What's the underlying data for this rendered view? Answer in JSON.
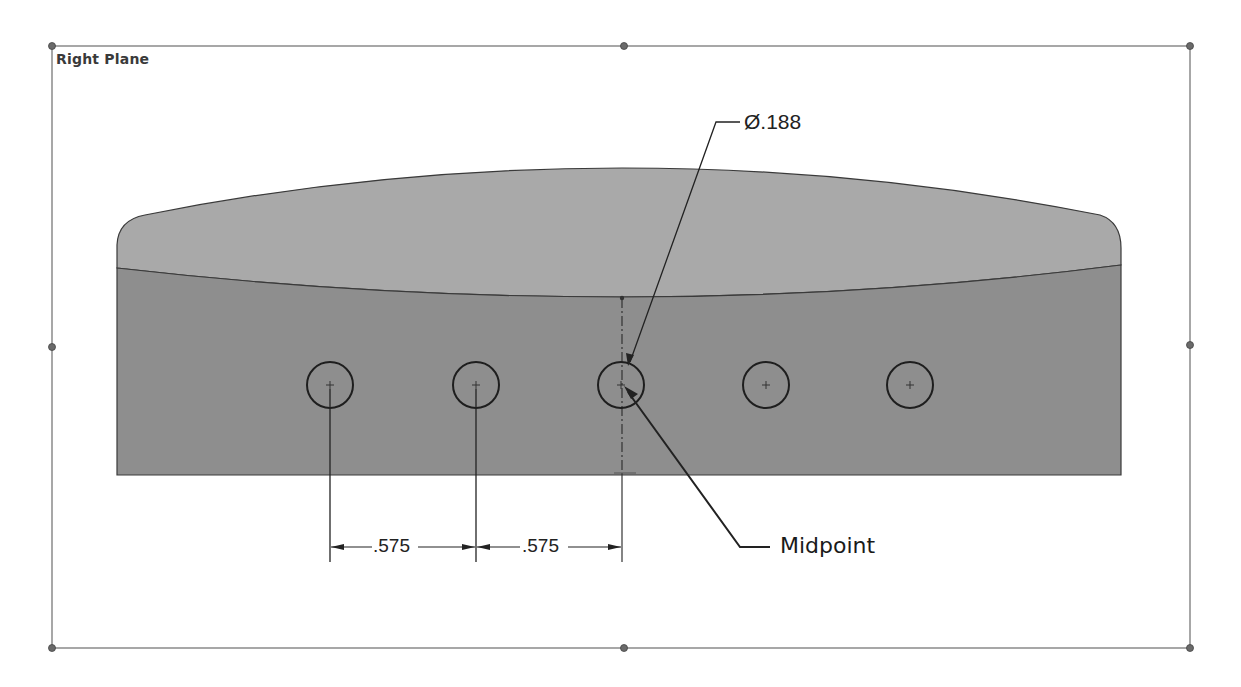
{
  "viewport": {
    "plane_label": "Right Plane",
    "frame": {
      "x1": 52,
      "y1": 46,
      "x2": 1190,
      "y2": 648,
      "color": "#8a8a8a"
    },
    "handles": [
      {
        "x": 52,
        "y": 46
      },
      {
        "x": 624,
        "y": 46
      },
      {
        "x": 1190,
        "y": 46
      },
      {
        "x": 52,
        "y": 347
      },
      {
        "x": 1190,
        "y": 345
      },
      {
        "x": 52,
        "y": 648
      },
      {
        "x": 624,
        "y": 648
      },
      {
        "x": 1190,
        "y": 648
      }
    ]
  },
  "part": {
    "upper_face_color": "#a8a8a8",
    "lower_face_color": "#8c8c8c",
    "edge_color": "#3a3a3a"
  },
  "sketch": {
    "holes": [
      {
        "id": "hole-1",
        "cx": 330,
        "cy": 385,
        "r": 23
      },
      {
        "id": "hole-2",
        "cx": 476,
        "cy": 385,
        "r": 23
      },
      {
        "id": "hole-3",
        "cx": 621,
        "cy": 385,
        "r": 23
      },
      {
        "id": "hole-4",
        "cx": 766,
        "cy": 385,
        "r": 23
      },
      {
        "id": "hole-5",
        "cx": 910,
        "cy": 385,
        "r": 23
      }
    ],
    "dimensions": [
      {
        "id": "spacing-1",
        "label": ".575",
        "x": 388,
        "y": 538
      },
      {
        "id": "spacing-2",
        "label": ".575",
        "x": 524,
        "y": 538
      }
    ],
    "diameter_dimension": {
      "label": "Ø.188",
      "x": 742,
      "y": 110
    }
  },
  "callouts": {
    "midpoint": {
      "label": "Midpoint",
      "x": 780,
      "y": 533
    }
  }
}
